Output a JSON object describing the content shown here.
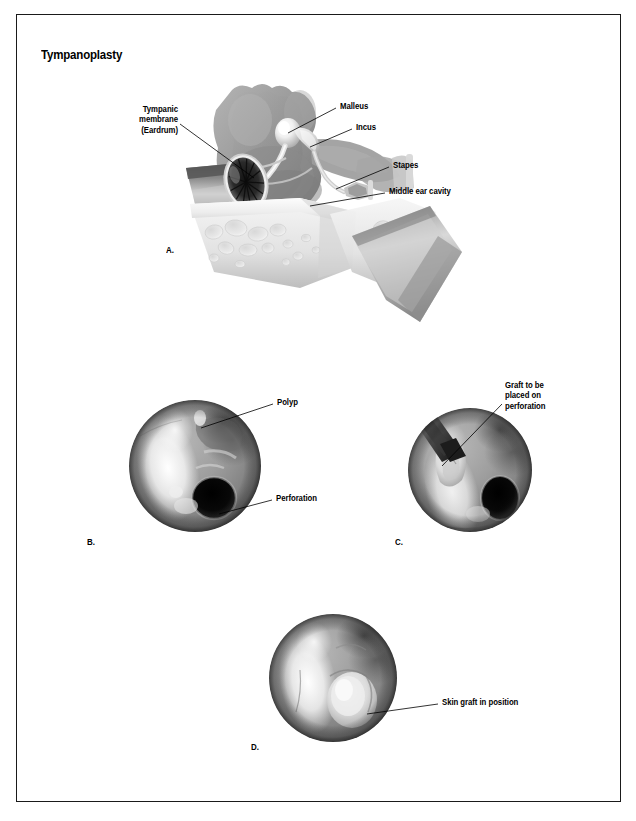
{
  "figure": {
    "title": "Tympanoplasty",
    "border_color": "#1a1a1a",
    "background_color": "#ffffff",
    "ink_color": "#000000"
  },
  "panels": [
    {
      "id": "A",
      "letter": "A.",
      "caption": "Normal middle ear anatomy, cutaway view"
    },
    {
      "id": "B",
      "letter": "B.",
      "caption": "Otoscopic view showing polyp and perforation"
    },
    {
      "id": "C",
      "letter": "C.",
      "caption": "Graft being positioned over perforation"
    },
    {
      "id": "D",
      "letter": "D.",
      "caption": "Skin graft healed in position"
    }
  ],
  "annotations": {
    "panel_a": [
      {
        "name": "tympanic-membrane",
        "text": "Tympanic\nmembrane\n(Eardrum)",
        "align": "right"
      },
      {
        "name": "malleus",
        "text": "Malleus",
        "align": "left"
      },
      {
        "name": "incus",
        "text": "Incus",
        "align": "left"
      },
      {
        "name": "stapes",
        "text": "Stapes",
        "align": "left"
      },
      {
        "name": "middle-ear-cavity",
        "text": "Middle ear cavity",
        "align": "left"
      }
    ],
    "panel_b": [
      {
        "name": "polyp",
        "text": "Polyp",
        "align": "left"
      },
      {
        "name": "perforation",
        "text": "Perforation",
        "align": "left"
      }
    ],
    "panel_c": [
      {
        "name": "graft-to-be-placed",
        "text": "Graft to be\nplaced on\nperforation",
        "align": "left"
      }
    ],
    "panel_d": [
      {
        "name": "skin-graft-in-position",
        "text": "Skin graft in position",
        "align": "left"
      }
    ]
  },
  "illustration": {
    "style": "grayscale airbrush medical illustration",
    "tones": {
      "bone_light": "#f2f2f2",
      "bone_mid": "#d8d8d8",
      "cavity_gray": "#9a9a9a",
      "tissue_mid": "#8d8d8d",
      "tissue_dark": "#5a5a5a",
      "shadow": "#3a3a3a",
      "perforation_black": "#0d0d0d",
      "highlight_white": "#fbfbfb"
    }
  }
}
